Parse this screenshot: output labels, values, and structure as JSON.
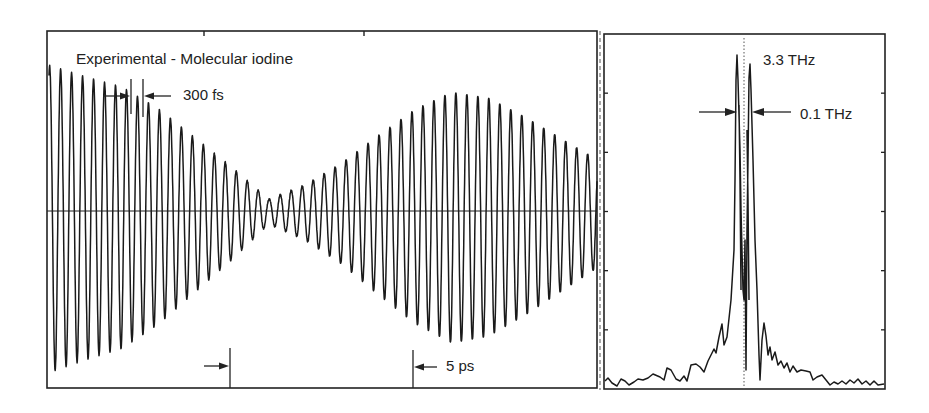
{
  "figure": {
    "background": "#ffffff",
    "ink_color": "#1a1a1a",
    "panels": [
      "time-domain",
      "frequency-spectrum"
    ]
  },
  "labels": {
    "title": "Experimental - Molecular iodine",
    "period_marker": "300 fs",
    "time_scale_marker": "5 ps",
    "peak_frequency": "3.3 THz",
    "peak_width": "0.1 THz"
  },
  "chart_data": [
    {
      "type": "line",
      "title": "Experimental - Molecular iodine",
      "panel": "left",
      "xlabel": "time",
      "ylabel": "signal",
      "description": "Oscillating pump-probe transient with ~300 fs period showing beat envelope: decays to a node near ~6 ps then revives to a maximum near ~11 ps and decays again",
      "oscillation_period_fs": 300,
      "scale_bar": {
        "label": "5 ps",
        "duration_ps": 5
      },
      "envelope": {
        "t_ps": [
          0,
          1,
          2,
          3,
          4,
          5,
          6,
          7,
          8,
          9,
          10,
          11,
          12,
          13,
          14,
          15,
          16,
          17,
          18
        ],
        "amplitude": [
          1.0,
          0.92,
          0.85,
          0.7,
          0.5,
          0.3,
          0.08,
          0.18,
          0.33,
          0.52,
          0.7,
          0.82,
          0.78,
          0.65,
          0.5,
          0.35,
          0.2,
          0.1,
          0.06
        ]
      },
      "grid": false,
      "zero_line": true
    },
    {
      "type": "line",
      "title": "",
      "panel": "right",
      "xlabel": "frequency (THz)",
      "ylabel": "spectral amplitude",
      "description": "Fourier spectrum of the time-domain trace: strong doublet peak centered at 3.3 THz, split by ~0.1 THz, with low broad background",
      "annotations": [
        {
          "text": "3.3 THz",
          "meaning": "center frequency (dotted line)"
        },
        {
          "text": "0.1 THz",
          "meaning": "doublet splitting"
        }
      ],
      "peaks": [
        {
          "freq_thz": 3.25,
          "rel_height": 1.0
        },
        {
          "freq_thz": 3.35,
          "rel_height": 0.92
        }
      ],
      "y_ticks_count": 5,
      "grid": false
    }
  ]
}
